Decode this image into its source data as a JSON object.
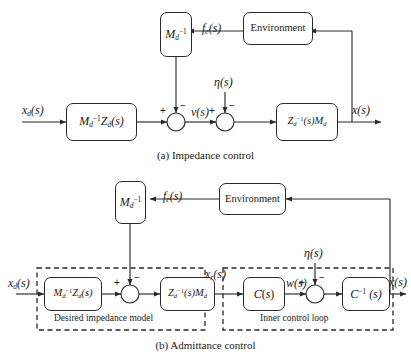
{
  "figure": {
    "background": "#ffffff",
    "line_color": "#2a2a2a"
  },
  "panel_a": {
    "caption": "(a) Impedance control",
    "blocks": [
      {
        "name": "md-inverse",
        "label_main": "M",
        "label_sub": "d",
        "label_sup": "-1"
      },
      {
        "name": "environment",
        "label_main": "Environment"
      },
      {
        "name": "md-inv-zd",
        "label_main": "M",
        "label_sub": "d",
        "label_sup": "-1",
        "label_tail_main": "Z",
        "label_tail_sub": "d",
        "label_tail_arg": "(s)"
      },
      {
        "name": "zd-inv-md",
        "label_main": "Z",
        "label_sub": "d",
        "label_sup": "-1",
        "label_arg": "(s)",
        "label_tail_main": "M",
        "label_tail_sub": "d"
      }
    ],
    "signals": {
      "input": {
        "base": "x",
        "sub": "d",
        "arg": "(s)"
      },
      "force": {
        "base": "f",
        "sub": "e",
        "arg": "(s)"
      },
      "velocity": {
        "base": "v",
        "arg": "(s)"
      },
      "noise": {
        "base": "η",
        "arg": "(s)"
      },
      "output": {
        "base": "x",
        "arg": "(s)"
      }
    },
    "junction_signs": {
      "sum1_left": "+",
      "sum1_top": "−",
      "sum2_left": "+",
      "sum2_top": "−"
    }
  },
  "panel_b": {
    "caption": "(b) Admittance control",
    "blocks": [
      {
        "name": "md-inverse",
        "label_main": "M",
        "label_sub": "d",
        "label_sup": "-1"
      },
      {
        "name": "environment",
        "label_main": "Environment"
      },
      {
        "name": "md-inv-zd",
        "label_main": "M",
        "label_sub": "d",
        "label_sup": "-1",
        "label_tail_main": "Z",
        "label_tail_sub": "d",
        "label_tail_arg": "(s)"
      },
      {
        "name": "zd-inv-md",
        "label_main": "Z",
        "label_sub": "d",
        "label_sup": "-1",
        "label_arg": "(s)",
        "label_tail_main": "M",
        "label_tail_sub": "d"
      },
      {
        "name": "controller",
        "label_main": "C",
        "label_arg": "(s)"
      },
      {
        "name": "controller-inverse",
        "label_main": "C",
        "label_sup": "-1",
        "label_arg": "(s)"
      }
    ],
    "groups": [
      {
        "name": "desired-impedance-model",
        "label": "Desired impedance model"
      },
      {
        "name": "inner-control-loop",
        "label": "Inner control loop"
      }
    ],
    "signals": {
      "input": {
        "base": "x",
        "sub": "d",
        "arg": "(s)"
      },
      "force": {
        "base": "f",
        "sub": "e",
        "arg": "(s)"
      },
      "reference": {
        "base": "x",
        "sub": "r",
        "arg": "(s)"
      },
      "inner": {
        "base": "w",
        "arg": "(s)"
      },
      "noise": {
        "base": "η",
        "arg": "(s)"
      },
      "output": {
        "base": "x",
        "arg": "(s)"
      }
    },
    "junction_signs": {
      "sum1_left": "+",
      "sum1_top": "−",
      "sum2_left": "+",
      "sum2_top": "−"
    }
  }
}
